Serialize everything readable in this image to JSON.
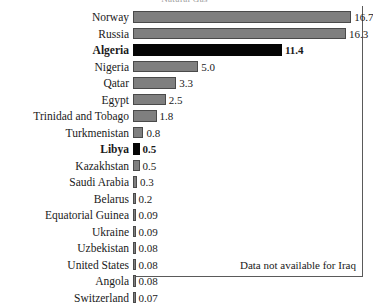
{
  "chart_data": {
    "type": "bar",
    "orientation": "horizontal",
    "title": "Natural Gas",
    "xlabel": "",
    "ylabel": "",
    "xlim": [
      0,
      17.6
    ],
    "grid": false,
    "legend": "none",
    "annotation": "Data not available for Iraq",
    "categories": [
      "Norway",
      "Russia",
      "Algeria",
      "Nigeria",
      "Qatar",
      "Egypt",
      "Trinidad and Tobago",
      "Turkmenistan",
      "Libya",
      "Kazakhstan",
      "Saudi Arabia",
      "Belarus",
      "Equatorial Guinea",
      "Ukraine",
      "Uzbekistan",
      "United States",
      "Angola",
      "Switzerland"
    ],
    "values": [
      16.7,
      16.3,
      11.4,
      5.0,
      3.3,
      2.5,
      1.8,
      0.8,
      0.5,
      0.5,
      0.3,
      0.2,
      0.09,
      0.09,
      0.08,
      0.08,
      0.08,
      0.07
    ],
    "value_labels": [
      "16.7",
      "16.3",
      "11.4",
      "5.0",
      "3.3",
      "2.5",
      "1.8",
      "0.8",
      "0.5",
      "0.5",
      "0.3",
      "0.2",
      "0.09",
      "0.09",
      "0.08",
      "0.08",
      "0.08",
      "0.07"
    ],
    "highlighted": [
      "Algeria",
      "Libya"
    ],
    "colors": {
      "bar": "#7f7f7f",
      "bar_highlight": "#050505",
      "bar_edge": "#4a4a4a",
      "axis": "#5a5a5a",
      "text": "#1a1a1a"
    }
  }
}
